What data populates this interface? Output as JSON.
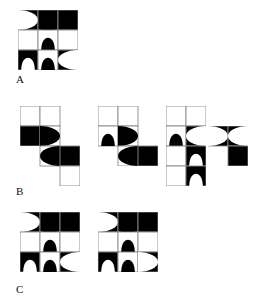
{
  "page": {
    "kind": "abstract-reasoning-tiles",
    "background_color": "#ffffff",
    "ink_color": "#000000",
    "grid_line_color": "#8a8a8a",
    "width": 266,
    "height": 303
  },
  "groups": [
    {
      "id": "A",
      "label": "A",
      "label_x": 16,
      "label_y": 74,
      "figures": [
        {
          "name": "figure-a-1",
          "x": 18,
          "y": 10,
          "cols": 3,
          "rows": 3,
          "cell": 20,
          "cells": [
            {
              "c": 0,
              "r": 0,
              "bg": "black",
              "motif": "half-disc",
              "side": "left",
              "motif_color": "white"
            },
            {
              "c": 1,
              "r": 0,
              "bg": "black",
              "motif": "dome",
              "side": "bottom",
              "motif_color": "black"
            },
            {
              "c": 2,
              "r": 0,
              "bg": "black",
              "motif": "half-disc",
              "side": "bottom",
              "motif_color": "white"
            },
            {
              "c": 0,
              "r": 1,
              "bg": "white",
              "motif": "none",
              "side": "",
              "motif_color": ""
            },
            {
              "c": 1,
              "r": 1,
              "bg": "white",
              "motif": "dome",
              "side": "bottom",
              "motif_color": "black"
            },
            {
              "c": 2,
              "r": 1,
              "bg": "white",
              "motif": "none",
              "side": "",
              "motif_color": ""
            },
            {
              "c": 0,
              "r": 2,
              "bg": "black",
              "motif": "dome",
              "side": "bottom",
              "motif_color": "white"
            },
            {
              "c": 1,
              "r": 2,
              "bg": "white",
              "motif": "dome",
              "side": "bottom",
              "motif_color": "black"
            },
            {
              "c": 2,
              "r": 2,
              "bg": "black",
              "motif": "half-disc",
              "side": "right",
              "motif_color": "white"
            }
          ]
        }
      ]
    },
    {
      "id": "B",
      "label": "B",
      "label_x": 16,
      "label_y": 186,
      "figures": [
        {
          "name": "figure-b-1",
          "x": 20,
          "y": 106,
          "cols": 3,
          "rows": 4,
          "cell": 20,
          "cells": [
            {
              "c": 0,
              "r": 0,
              "bg": "white",
              "motif": "none",
              "side": "",
              "motif_color": ""
            },
            {
              "c": 1,
              "r": 0,
              "bg": "white",
              "motif": "none",
              "side": "",
              "motif_color": ""
            },
            {
              "c": 0,
              "r": 1,
              "bg": "black",
              "motif": "half-disc",
              "side": "bottom",
              "motif_color": "white"
            },
            {
              "c": 1,
              "r": 1,
              "bg": "white",
              "motif": "half-disc",
              "side": "left",
              "motif_color": "black"
            },
            {
              "c": 1,
              "r": 2,
              "bg": "white",
              "motif": "half-disc",
              "side": "right",
              "motif_color": "black"
            },
            {
              "c": 2,
              "r": 2,
              "bg": "black",
              "motif": "half-disc",
              "side": "bottom",
              "motif_color": "white"
            },
            {
              "c": 2,
              "r": 3,
              "bg": "white",
              "motif": "none",
              "side": "",
              "motif_color": ""
            }
          ]
        },
        {
          "name": "figure-b-2",
          "x": 98,
          "y": 106,
          "cols": 3,
          "rows": 3,
          "cell": 20,
          "cells": [
            {
              "c": 0,
              "r": 0,
              "bg": "white",
              "motif": "none",
              "side": "",
              "motif_color": ""
            },
            {
              "c": 1,
              "r": 0,
              "bg": "white",
              "motif": "none",
              "side": "",
              "motif_color": ""
            },
            {
              "c": 0,
              "r": 1,
              "bg": "white",
              "motif": "dome",
              "side": "bottom",
              "motif_color": "black"
            },
            {
              "c": 1,
              "r": 1,
              "bg": "white",
              "motif": "half-disc",
              "side": "left",
              "motif_color": "black"
            },
            {
              "c": 1,
              "r": 2,
              "bg": "white",
              "motif": "half-disc",
              "side": "right",
              "motif_color": "black"
            },
            {
              "c": 2,
              "r": 2,
              "bg": "black",
              "motif": "half-disc",
              "side": "bottom",
              "motif_color": "white"
            }
          ]
        },
        {
          "name": "figure-b-3",
          "x": 166,
          "y": 106,
          "cols": 2,
          "rows": 4,
          "cell": 20,
          "cells": [
            {
              "c": 0,
              "r": 0,
              "bg": "white",
              "motif": "none",
              "side": "",
              "motif_color": ""
            },
            {
              "c": 1,
              "r": 0,
              "bg": "white",
              "motif": "none",
              "side": "",
              "motif_color": ""
            },
            {
              "c": 0,
              "r": 1,
              "bg": "white",
              "motif": "dome",
              "side": "bottom",
              "motif_color": "black"
            },
            {
              "c": 1,
              "r": 1,
              "bg": "black",
              "motif": "half-disc",
              "side": "right",
              "motif_color": "white"
            },
            {
              "c": 0,
              "r": 2,
              "bg": "white",
              "motif": "none",
              "side": "",
              "motif_color": ""
            },
            {
              "c": 1,
              "r": 2,
              "bg": "black",
              "motif": "dome",
              "side": "bottom",
              "motif_color": "white"
            },
            {
              "c": 0,
              "r": 3,
              "bg": "white",
              "motif": "none",
              "side": "",
              "motif_color": ""
            },
            {
              "c": 1,
              "r": 3,
              "bg": "black",
              "motif": "dome",
              "side": "bottom",
              "motif_color": "white"
            }
          ]
        },
        {
          "name": "figure-b-4-detached",
          "x": 208,
          "y": 126,
          "cols": 2,
          "rows": 2,
          "cell": 20,
          "cells": [
            {
              "c": 0,
              "r": 0,
              "bg": "black",
              "motif": "half-disc",
              "side": "left",
              "motif_color": "white"
            },
            {
              "c": 1,
              "r": 0,
              "bg": "black",
              "motif": "half-disc",
              "side": "right",
              "motif_color": "white"
            },
            {
              "c": 1,
              "r": 1,
              "bg": "black",
              "motif": "half-disc",
              "side": "bottom",
              "motif_color": "white"
            }
          ]
        }
      ]
    },
    {
      "id": "C",
      "label": "C",
      "label_x": 16,
      "label_y": 284,
      "figures": [
        {
          "name": "figure-c-1",
          "x": 20,
          "y": 212,
          "cols": 3,
          "rows": 3,
          "cell": 20,
          "cells": [
            {
              "c": 0,
              "r": 0,
              "bg": "black",
              "motif": "half-disc",
              "side": "left",
              "motif_color": "white"
            },
            {
              "c": 1,
              "r": 0,
              "bg": "black",
              "motif": "dome",
              "side": "bottom",
              "motif_color": "black"
            },
            {
              "c": 2,
              "r": 0,
              "bg": "black",
              "motif": "half-disc",
              "side": "bottom",
              "motif_color": "white"
            },
            {
              "c": 0,
              "r": 1,
              "bg": "white",
              "motif": "none",
              "side": "",
              "motif_color": ""
            },
            {
              "c": 1,
              "r": 1,
              "bg": "white",
              "motif": "dome",
              "side": "bottom",
              "motif_color": "black"
            },
            {
              "c": 2,
              "r": 1,
              "bg": "white",
              "motif": "none",
              "side": "",
              "motif_color": ""
            },
            {
              "c": 0,
              "r": 2,
              "bg": "black",
              "motif": "dome",
              "side": "bottom",
              "motif_color": "white"
            },
            {
              "c": 1,
              "r": 2,
              "bg": "white",
              "motif": "dome",
              "side": "bottom",
              "motif_color": "black"
            },
            {
              "c": 2,
              "r": 2,
              "bg": "black",
              "motif": "half-disc",
              "side": "right",
              "motif_color": "white"
            }
          ]
        },
        {
          "name": "figure-c-2",
          "x": 98,
          "y": 212,
          "cols": 3,
          "rows": 3,
          "cell": 20,
          "cells": [
            {
              "c": 0,
              "r": 0,
              "bg": "black",
              "motif": "half-disc",
              "side": "left",
              "motif_color": "white"
            },
            {
              "c": 1,
              "r": 0,
              "bg": "black",
              "motif": "dome",
              "side": "bottom",
              "motif_color": "black"
            },
            {
              "c": 2,
              "r": 0,
              "bg": "black",
              "motif": "half-disc",
              "side": "bottom",
              "motif_color": "white"
            },
            {
              "c": 0,
              "r": 1,
              "bg": "white",
              "motif": "none",
              "side": "",
              "motif_color": ""
            },
            {
              "c": 1,
              "r": 1,
              "bg": "white",
              "motif": "dome",
              "side": "bottom",
              "motif_color": "black"
            },
            {
              "c": 2,
              "r": 1,
              "bg": "white",
              "motif": "none",
              "side": "",
              "motif_color": ""
            },
            {
              "c": 0,
              "r": 2,
              "bg": "black",
              "motif": "dome",
              "side": "bottom",
              "motif_color": "white"
            },
            {
              "c": 1,
              "r": 2,
              "bg": "white",
              "motif": "dome",
              "side": "bottom",
              "motif_color": "black"
            },
            {
              "c": 2,
              "r": 2,
              "bg": "black",
              "motif": "half-disc",
              "side": "left",
              "motif_color": "white"
            }
          ]
        }
      ]
    }
  ]
}
